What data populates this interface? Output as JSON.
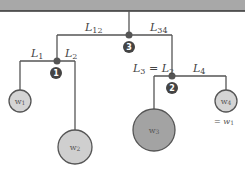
{
  "diagram": {
    "type": "mobile",
    "ceiling": {
      "color": "#a8a8a8",
      "border": "#333333"
    },
    "line_color": "#555555",
    "nodes": [
      {
        "id": "3",
        "label": "3"
      },
      {
        "id": "1",
        "label": "1"
      },
      {
        "id": "2",
        "label": "2"
      }
    ],
    "arms": {
      "L12": {
        "main": "L",
        "sub": "12"
      },
      "L34": {
        "main": "L",
        "sub": "34"
      },
      "L1": {
        "main": "L",
        "sub": "1"
      },
      "L2": {
        "main": "L",
        "sub": "2"
      },
      "L3": {
        "main": "L",
        "sub": "3",
        "eq": " = ",
        "main2": "L",
        "sub2": "2"
      },
      "L4": {
        "main": "L",
        "sub": "4"
      }
    },
    "weights": [
      {
        "id": "w1",
        "main": "w",
        "sub": "1",
        "color": "#d4d4d4"
      },
      {
        "id": "w2",
        "main": "w",
        "sub": "2",
        "color": "#cfcfcf"
      },
      {
        "id": "w3",
        "main": "w",
        "sub": "3",
        "color": "#a3a3a3"
      },
      {
        "id": "w4",
        "main": "w",
        "sub": "4",
        "color": "#d4d4d4"
      }
    ],
    "w4_note": {
      "prefix": "= ",
      "main": "w",
      "sub": "1"
    }
  }
}
